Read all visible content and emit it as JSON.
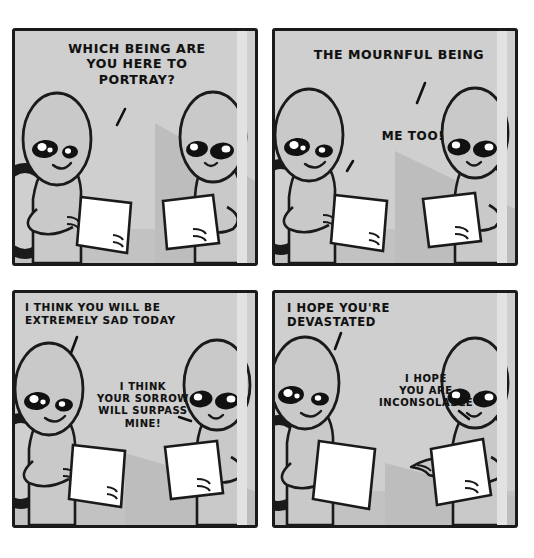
{
  "comic": {
    "title": "Two beings reading scripts",
    "page_background": "#ffffff",
    "panel_background": "#cfcfcf",
    "ink_color": "#1a1a1a",
    "paper_color": "#ffffff",
    "panels": [
      {
        "id": "panel-1",
        "position": "top-left",
        "dialogue": [
          {
            "speaker": "right-being",
            "text": "WHICH BEING ARE\nYOU HERE TO\nPORTRAY?"
          }
        ],
        "characters": [
          "left-being-reading-script",
          "right-being-reading-script"
        ],
        "props": [
          "script-paper",
          "dark-oval-chair-back"
        ]
      },
      {
        "id": "panel-2",
        "position": "top-right",
        "dialogue": [
          {
            "speaker": "right-being",
            "text": "THE MOURNFUL BEING"
          },
          {
            "speaker": "left-being",
            "text": "ME TOO!"
          }
        ],
        "characters": [
          "left-being-reading-script",
          "right-being-reading-script"
        ],
        "props": [
          "script-paper",
          "dark-oval-chair-back"
        ]
      },
      {
        "id": "panel-3",
        "position": "bottom-left",
        "dialogue": [
          {
            "speaker": "left-being",
            "text": "I THINK YOU WILL BE\nEXTREMELY SAD TODAY"
          },
          {
            "speaker": "right-being",
            "text": "I THINK\nYOUR SORROW\nWILL SURPASS\nMINE!"
          }
        ],
        "characters": [
          "left-being-reading-script",
          "right-being-reading-script"
        ],
        "props": [
          "script-paper",
          "dark-oval-chair-back"
        ]
      },
      {
        "id": "panel-4",
        "position": "bottom-right",
        "dialogue": [
          {
            "speaker": "left-being",
            "text": "I HOPE YOU'RE\nDEVASTATED"
          },
          {
            "speaker": "right-being",
            "text": "I HOPE\nYOU ARE\nINCONSOLABLE"
          }
        ],
        "characters": [
          "left-being-reading-script",
          "right-being-gesturing"
        ],
        "props": [
          "script-paper",
          "dark-oval-chair-back"
        ]
      }
    ]
  }
}
